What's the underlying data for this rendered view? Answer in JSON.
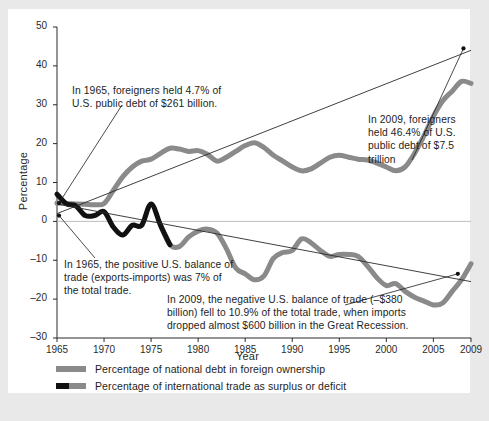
{
  "chart_data": {
    "type": "line",
    "title": "",
    "xlabel": "Year",
    "ylabel": "Percentage",
    "xlim": [
      1965,
      2009
    ],
    "ylim": [
      -30,
      50
    ],
    "xticks": [
      "1965",
      "1970",
      "1975",
      "1980",
      "1985",
      "1990",
      "1995",
      "2000",
      "2005",
      "2009"
    ],
    "yticks": [
      "50",
      "40",
      "30",
      "20",
      "10",
      "0",
      "-10",
      "-20",
      "-30"
    ],
    "grid": false,
    "zero_line": true,
    "legend_position": "below-axis",
    "series": [
      {
        "name": "Percentage of national debt in foreign ownership",
        "color": "#8a8a8a",
        "x": [
          1965,
          1966,
          1967,
          1968,
          1969,
          1970,
          1971,
          1972,
          1973,
          1974,
          1975,
          1976,
          1977,
          1978,
          1979,
          1980,
          1981,
          1982,
          1983,
          1984,
          1985,
          1986,
          1987,
          1988,
          1989,
          1990,
          1991,
          1992,
          1993,
          1994,
          1995,
          1996,
          1997,
          1998,
          1999,
          2000,
          2001,
          2002,
          2003,
          2004,
          2005,
          2006,
          2007,
          2008,
          2009
        ],
        "values": [
          4.7,
          4.6,
          4.5,
          4.4,
          4.3,
          4.6,
          8.0,
          11.5,
          14.0,
          15.5,
          16.0,
          17.5,
          18.8,
          18.6,
          18.0,
          18.2,
          17.2,
          15.5,
          16.5,
          18.0,
          19.5,
          20.2,
          19.0,
          17.0,
          15.5,
          14.0,
          13.0,
          13.5,
          15.0,
          16.5,
          17.0,
          16.5,
          16.0,
          15.8,
          15.0,
          14.0,
          13.0,
          14.0,
          17.5,
          22.0,
          27.0,
          31.0,
          33.5,
          36.0,
          35.5
        ]
      },
      {
        "name": "Percentage of international trade as surplus or deficit",
        "color": "#111111",
        "color_late": "#8a8a8a",
        "black_until_year": 1976,
        "x": [
          1965,
          1966,
          1967,
          1968,
          1969,
          1970,
          1971,
          1972,
          1973,
          1974,
          1975,
          1976,
          1977,
          1978,
          1979,
          1980,
          1981,
          1982,
          1983,
          1984,
          1985,
          1986,
          1987,
          1988,
          1989,
          1990,
          1991,
          1992,
          1993,
          1994,
          1995,
          1996,
          1997,
          1998,
          1999,
          2000,
          2001,
          2002,
          2003,
          2004,
          2005,
          2006,
          2007,
          2008,
          2009
        ],
        "values": [
          7.0,
          4.5,
          4.0,
          1.5,
          1.5,
          2.5,
          -1.5,
          -3.5,
          -1.0,
          -1.0,
          4.5,
          -1.0,
          -6.0,
          -6.5,
          -4.0,
          -2.5,
          -2.0,
          -3.0,
          -7.0,
          -12.0,
          -13.5,
          -15.0,
          -14.0,
          -9.5,
          -8.0,
          -7.5,
          -4.5,
          -5.5,
          -7.5,
          -9.0,
          -8.5,
          -8.5,
          -9.0,
          -11.5,
          -14.5,
          -16.5,
          -16.0,
          -18.0,
          -19.5,
          -20.5,
          -21.5,
          -21.0,
          -18.0,
          -15.0,
          -10.9
        ]
      }
    ],
    "trendlines": [
      {
        "name": "debt-trendline",
        "from": [
          1965,
          2.0
        ],
        "to": [
          2009,
          44.0
        ],
        "direction": "ascending",
        "color": "#2a2a2a"
      },
      {
        "name": "trade-trendline",
        "from": [
          1965,
          4.5
        ],
        "to": [
          2009,
          -15.5
        ],
        "direction": "descending",
        "color": "#2a2a2a"
      }
    ],
    "annotations": [
      {
        "id": "debt-1965",
        "text": "In 1965, foreigners held 4.7% of U.S. public debt of $261 billion.",
        "points_to": [
          1965,
          4.7
        ],
        "year": 1965,
        "value": 4.7,
        "amount": "$261 billion"
      },
      {
        "id": "debt-2009",
        "text": "In 2009, foreigners held 46.4% of U.S. public debt of $7.5 trillion",
        "points_to": [
          2009,
          46.4
        ],
        "year": 2009,
        "value": 46.4,
        "amount": "$7.5 trillion"
      },
      {
        "id": "trade-1965",
        "text": "In 1965, the positive U.S. balance of trade (exports-imports) was 7% of the total trade.",
        "points_to": [
          1965,
          7.0
        ],
        "year": 1965,
        "value": 7.0
      },
      {
        "id": "trade-2009",
        "text": "In 2009, the negative U.S. balance of trade (–$380 billion) fell to 10.9% of the total trade, when imports dropped almost $600 billion in the Great Recession.",
        "points_to": [
          2009,
          -10.9
        ],
        "year": 2009,
        "value": -10.9,
        "amount": "–$380 billion"
      }
    ]
  },
  "legend": {
    "items": [
      {
        "label": "Percentage of national debt in foreign ownership",
        "swatch": "debt"
      },
      {
        "label": "Percentage of international trade as surplus or deficit",
        "swatch": "trade"
      }
    ]
  },
  "colors": {
    "debt_line": "#8a8a8a",
    "trade_line_early": "#111111",
    "trade_line_late": "#8a8a8a",
    "axis": "#2a2a2a",
    "card_background": "#ffffff",
    "page_background": "#e9e9e9"
  }
}
